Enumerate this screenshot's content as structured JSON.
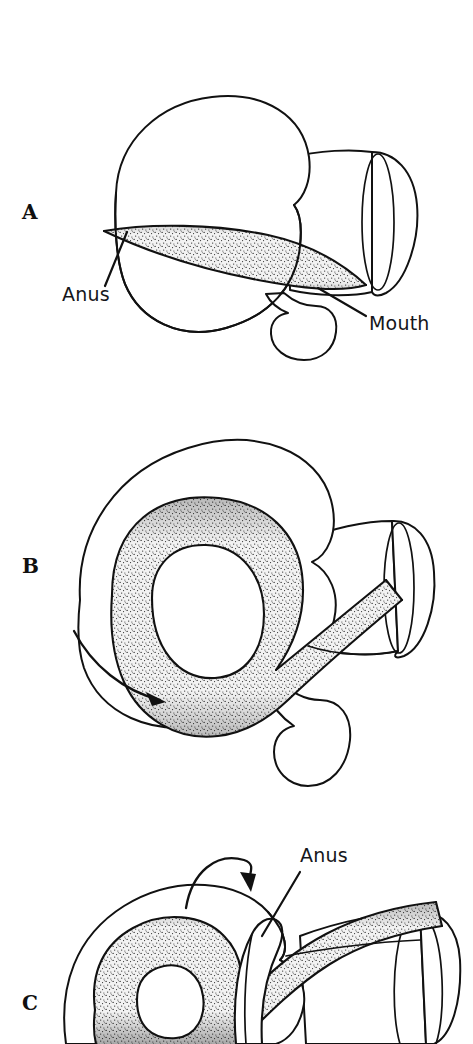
{
  "figure": {
    "background_color": "#ffffff",
    "ink_color": "#111111",
    "stipple_color": "#1a1a1a",
    "width": 473,
    "height": 1044,
    "panel_count": 3
  },
  "panels": [
    {
      "id": "A",
      "letter": "A",
      "letter_x": 22,
      "letter_y": 219,
      "stage": "untorted",
      "description": "Pre-torsion larva: gut runs straight from mouth at front-right to anus at rear-left; visceral mass not yet rotated.",
      "labels": [
        {
          "key": "anus",
          "text": "Anus",
          "text_x": 62,
          "text_y": 301,
          "leader_from_x": 105,
          "leader_from_y": 286,
          "leader_to_x": 127,
          "leader_to_y": 232
        },
        {
          "key": "mouth",
          "text": "Mouth",
          "text_x": 369,
          "text_y": 330,
          "leader_from_x": 366,
          "leader_from_y": 316,
          "leader_to_x": 318,
          "leader_to_y": 288
        }
      ],
      "arrows": []
    },
    {
      "id": "B",
      "letter": "B",
      "letter_x": 22,
      "letter_y": 573,
      "stage": "mid-torsion",
      "description": "Torsion underway: the gut has looped into a U as the visceral mass rotates counterclockwise; rotation arrow at lower left.",
      "labels": [],
      "arrows": [
        {
          "key": "rotation-arrow-b",
          "kind": "sweeping-curve",
          "direction": "counterclockwise-sweep-right",
          "start_x": 74,
          "start_y": 631,
          "end_x": 166,
          "end_y": 702,
          "head_angle_deg": 38
        }
      ]
    },
    {
      "id": "C",
      "letter": "C",
      "letter_x": 22,
      "letter_y": 1010,
      "stage": "torted",
      "description": "Torsion complete: the gut loop has swung over the top so the anus now opens anteriorly above the head; panel cropped at image bottom edge.",
      "labels": [
        {
          "key": "anus",
          "text": "Anus",
          "text_x": 300,
          "text_y": 862,
          "leader_from_x": 300,
          "leader_from_y": 872,
          "leader_to_x": 262,
          "leader_to_y": 936
        }
      ],
      "arrows": [
        {
          "key": "rotation-arrow-c",
          "kind": "arched-over-top",
          "direction": "clockwise-over-top-to-right",
          "start_x": 186,
          "start_y": 908,
          "end_x": 251,
          "end_y": 890,
          "head_angle_deg": 105
        }
      ]
    }
  ],
  "structures": {
    "visceral_mass": "visceral-mass-outline",
    "gut": "stippled-gut-tube",
    "head_foot": "head-foot-lobe",
    "mantle_funnel": "mantle-cavity-funnel",
    "funnel_opening": "funnel-elliptical-opening"
  }
}
